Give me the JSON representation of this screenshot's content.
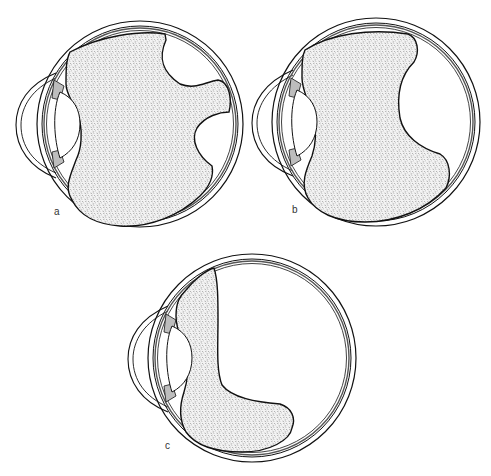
{
  "figure": {
    "colors": {
      "line": "#111111",
      "stipple": "#8a8a8a",
      "background": "#ffffff"
    },
    "panels": [
      {
        "id": "a",
        "label": "a",
        "description": "Vitreous body with two lacunae on posterior side separated by a tongue"
      },
      {
        "id": "b",
        "label": "b",
        "description": "Vitreous body with one large posterior lacuna"
      },
      {
        "id": "c",
        "label": "c",
        "description": "Collapsed vitreous body, L-shaped along anterior and inferior wall"
      }
    ]
  }
}
